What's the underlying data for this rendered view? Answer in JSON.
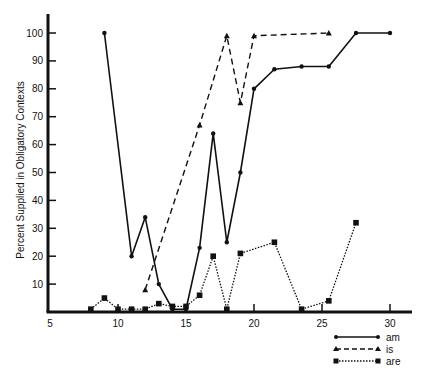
{
  "chart_data": {
    "type": "line",
    "title": "",
    "xlabel": "",
    "ylabel": "Percent Supplied in Obligatory Contexts",
    "xlim": [
      5,
      32
    ],
    "ylim": [
      0,
      105
    ],
    "xticks": [
      5,
      10,
      15,
      20,
      25,
      30
    ],
    "yticks": [
      10,
      20,
      30,
      40,
      50,
      60,
      70,
      80,
      90,
      100
    ],
    "grid": false,
    "legend_position": "bottom-right",
    "series": [
      {
        "name": "am",
        "style": "solid",
        "marker": "circle",
        "points": [
          [
            9,
            100
          ],
          [
            11,
            20
          ],
          [
            12,
            34
          ],
          [
            13,
            10
          ],
          [
            14,
            1
          ],
          [
            15,
            1
          ],
          [
            16,
            23
          ],
          [
            17,
            64
          ],
          [
            18,
            25
          ],
          [
            19,
            50
          ],
          [
            20,
            80
          ],
          [
            21.5,
            87
          ],
          [
            23.5,
            88
          ],
          [
            25.5,
            88
          ],
          [
            27.5,
            100
          ],
          [
            30,
            100
          ]
        ]
      },
      {
        "name": "is",
        "style": "dashed",
        "marker": "triangle",
        "points": [
          [
            12,
            8
          ],
          [
            16,
            67
          ],
          [
            18,
            99
          ],
          [
            19,
            75
          ],
          [
            20,
            99
          ],
          [
            25.5,
            100
          ]
        ]
      },
      {
        "name": "are",
        "style": "dotted",
        "marker": "square",
        "points": [
          [
            8,
            1
          ],
          [
            9,
            5
          ],
          [
            10,
            1
          ],
          [
            11,
            1
          ],
          [
            12,
            1
          ],
          [
            13,
            3
          ],
          [
            14,
            2
          ],
          [
            15,
            2
          ],
          [
            16,
            6
          ],
          [
            17,
            20
          ],
          [
            18,
            1
          ],
          [
            19,
            21
          ],
          [
            21.5,
            25
          ],
          [
            23.5,
            1
          ],
          [
            25.5,
            4
          ],
          [
            27.5,
            32
          ]
        ]
      }
    ]
  },
  "legend": {
    "items": [
      {
        "label": "am"
      },
      {
        "label": "is"
      },
      {
        "label": "are"
      }
    ]
  }
}
